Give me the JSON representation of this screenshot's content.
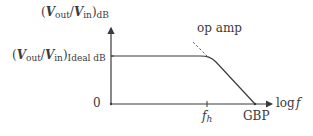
{
  "diagram": {
    "type": "frequency-response-bode",
    "y_axis_label": {
      "V1": "V",
      "s1": "out",
      "V2": "V",
      "s2": "in",
      "suffix": "dB"
    },
    "ideal_level_label": {
      "V1": "V",
      "s1": "out",
      "V2": "V",
      "s2": "in",
      "suffix": "Ideal dB"
    },
    "zero_label": "0",
    "x_axis_label": {
      "prefix": "log",
      "var": "f"
    },
    "fh_label": {
      "f": "f",
      "sub": "h"
    },
    "gbp_label": "GBP",
    "curve_label": "op amp",
    "colors": {
      "line": "#3a3a3a",
      "dashed": "#666666",
      "text": "#3a3a3a"
    }
  }
}
